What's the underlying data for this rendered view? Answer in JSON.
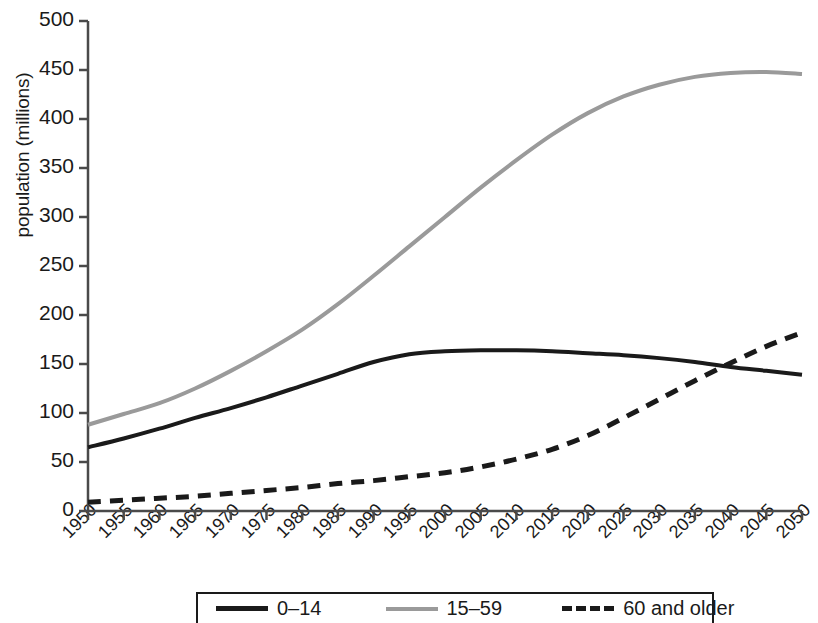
{
  "chart_data": {
    "type": "line",
    "title": "",
    "xlabel": "",
    "ylabel": "population (millions)",
    "xlim": [
      1950,
      2050
    ],
    "ylim": [
      0,
      500
    ],
    "grid": false,
    "legend_position": "bottom",
    "x": [
      1950,
      1955,
      1960,
      1965,
      1970,
      1975,
      1980,
      1985,
      1990,
      1995,
      2000,
      2005,
      2010,
      2015,
      2020,
      2025,
      2030,
      2035,
      2040,
      2045,
      2050
    ],
    "xticklabels": [
      "1950",
      "1955",
      "1960",
      "1965",
      "1970",
      "1975",
      "1980",
      "1985",
      "1990",
      "1995",
      "2000",
      "2005",
      "2010",
      "2015",
      "2020",
      "2025",
      "2030",
      "2035",
      "2040",
      "2045",
      "2050"
    ],
    "yticks": [
      0,
      50,
      100,
      150,
      200,
      250,
      300,
      350,
      400,
      450,
      500
    ],
    "yticklabels": [
      "0",
      "50",
      "100",
      "150",
      "200",
      "250",
      "300",
      "350",
      "400",
      "450",
      "500"
    ],
    "series": [
      {
        "name": "0-14",
        "legend_label": "0–14",
        "color": "#1a1a1a",
        "style": "solid",
        "width": 4,
        "values": [
          65,
          74,
          84,
          95,
          105,
          116,
          128,
          140,
          152,
          160,
          163,
          164,
          164,
          163,
          161,
          159,
          156,
          152,
          147,
          143,
          139
        ]
      },
      {
        "name": "15-59",
        "legend_label": "15–59",
        "color": "#9a9a9a",
        "style": "solid",
        "width": 4,
        "values": [
          88,
          99,
          110,
          125,
          143,
          163,
          185,
          211,
          240,
          270,
          300,
          330,
          358,
          384,
          406,
          423,
          435,
          443,
          447,
          448,
          446
        ]
      },
      {
        "name": "60 and older",
        "legend_label": "60 and older",
        "color": "#1a1a1a",
        "style": "dashed",
        "width": 5,
        "values": [
          9,
          11,
          13,
          15,
          18,
          21,
          24,
          28,
          31,
          35,
          39,
          45,
          53,
          63,
          77,
          95,
          114,
          133,
          151,
          168,
          182
        ]
      }
    ]
  },
  "axis": {
    "ylabel": "population (millions)"
  },
  "legend": {
    "entries": [
      {
        "label": "0–14"
      },
      {
        "label": "15–59"
      },
      {
        "label": "60 and older"
      }
    ]
  }
}
